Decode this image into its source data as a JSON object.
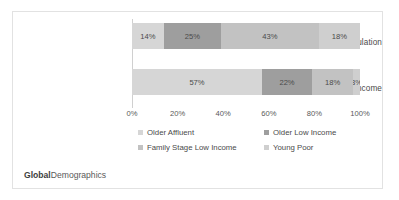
{
  "footer": {
    "brand_bold": "Global",
    "brand_rest": "Demographics"
  },
  "colors": {
    "older_affluent": "#d6d6d6",
    "older_low_income": "#9e9e9e",
    "family_stage_low_income": "#c2c2c2",
    "young_poor": "#cfcfcf",
    "frame_border": "#e2e2e2",
    "axis_line": "#d0d0d0",
    "text": "#4a4a4a"
  },
  "chart_data": {
    "type": "bar",
    "orientation": "horizontal",
    "stacked": true,
    "stack_total": 100,
    "title": "",
    "xlabel": "",
    "ylabel": "",
    "xlim": [
      0,
      100
    ],
    "grid": false,
    "legend_position": "bottom",
    "categories": [
      "Share of Total Population",
      "Share of Total Income"
    ],
    "xticks": [
      "0%",
      "20%",
      "40%",
      "60%",
      "80%",
      "100%"
    ],
    "xtick_values": [
      0,
      20,
      40,
      60,
      80,
      100
    ],
    "series": [
      {
        "name": "Older Affluent",
        "color": "#d6d6d6",
        "values": [
          14,
          57
        ],
        "labels": [
          "14%",
          "57%"
        ]
      },
      {
        "name": "Older Low Income",
        "color": "#9e9e9e",
        "values": [
          25,
          22
        ],
        "labels": [
          "25%",
          "22%"
        ]
      },
      {
        "name": "Family Stage Low Income",
        "color": "#c2c2c2",
        "values": [
          43,
          18
        ],
        "labels": [
          "43%",
          "18%"
        ]
      },
      {
        "name": "Young Poor",
        "color": "#cfcfcf",
        "values": [
          18,
          3
        ],
        "labels": [
          "18%",
          "3%"
        ]
      }
    ]
  }
}
